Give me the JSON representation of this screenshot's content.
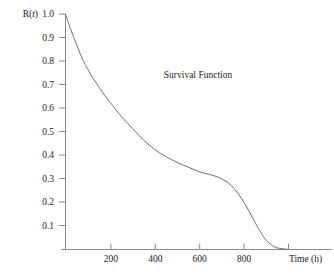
{
  "chart_data": {
    "type": "line",
    "title": "Survival Function",
    "xlabel": "Time (h)",
    "ylabel": "R(t)",
    "ylabel_parts": {
      "symbol": "R(",
      "variable": "t",
      "close": ")"
    },
    "xlim": [
      0,
      1000
    ],
    "ylim": [
      0,
      1.0
    ],
    "grid": false,
    "legend": null,
    "x_ticks": [
      200,
      400,
      600,
      800
    ],
    "x_tick_labels": [
      "200",
      "400",
      "600",
      "800"
    ],
    "x_minor_ticks": [
      0,
      1000
    ],
    "y_ticks": [
      0.1,
      0.2,
      0.3,
      0.4,
      0.5,
      0.6,
      0.7,
      0.8,
      0.9,
      1.0
    ],
    "y_tick_labels": [
      "0.1",
      "0.2",
      "0.3",
      "0.4",
      "0.5",
      "0.6",
      "0.7",
      "0.8",
      "0.9",
      "1.0"
    ],
    "series": [
      {
        "name": "Survival Function",
        "color": "#6e6e6e",
        "x": [
          0,
          25,
          50,
          75,
          100,
          125,
          150,
          175,
          200,
          250,
          300,
          350,
          400,
          450,
          500,
          550,
          600,
          640,
          670,
          700,
          730,
          760,
          790,
          820,
          850,
          880,
          900,
          920,
          940,
          960,
          1000
        ],
        "y": [
          1.0,
          0.93,
          0.87,
          0.81,
          0.765,
          0.725,
          0.69,
          0.655,
          0.625,
          0.565,
          0.515,
          0.465,
          0.425,
          0.395,
          0.37,
          0.35,
          0.33,
          0.32,
          0.312,
          0.3,
          0.283,
          0.255,
          0.215,
          0.168,
          0.115,
          0.065,
          0.04,
          0.022,
          0.01,
          0.005,
          0.0
        ]
      }
    ]
  },
  "axes": {
    "tick_color": "#8a8a8a",
    "text_color": "#1a1a1a",
    "background": "#ffffff"
  }
}
